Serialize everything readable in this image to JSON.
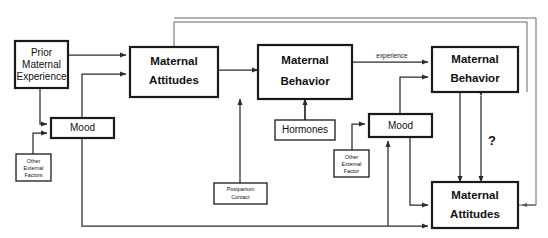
{
  "figure": {
    "type": "flow-diagram",
    "background_color": "#ffffff",
    "line_color": "#2b2b2b",
    "box_fill": "#ffffff",
    "box_border_color": "#1a1a1a"
  },
  "nodes": {
    "prior_maternal_experience": {
      "line1": "Prior",
      "line2": "Maternal",
      "line3": "Experience"
    },
    "maternal_attitudes_left": {
      "line1": "Maternal",
      "line2": "Attitudes"
    },
    "maternal_behavior_center": {
      "line1": "Maternal",
      "line2": "Behavior"
    },
    "maternal_behavior_right": {
      "line1": "Maternal",
      "line2": "Behavior"
    },
    "maternal_attitudes_right": {
      "line1": "Maternal",
      "line2": "Attitudes"
    },
    "mood_left": {
      "label": "Mood"
    },
    "mood_right": {
      "label": "Mood"
    },
    "hormones": {
      "label": "Hormones"
    },
    "other_external_factors_left": {
      "line1": "Other",
      "line2": "External",
      "line3": "Factors"
    },
    "other_external_factor_right": {
      "line1": "Other",
      "line2": "External",
      "line3": "Factor"
    },
    "postpartum_contact": {
      "line1": "Postpartum",
      "line2": "Contact"
    }
  },
  "edge_labels": {
    "experience": "experience",
    "question": "?"
  }
}
